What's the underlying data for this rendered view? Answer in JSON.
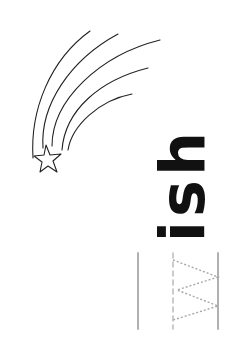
{
  "worksheet": {
    "word_remaining": "ish",
    "traced_letter": "W",
    "colors": {
      "ink": "#111111",
      "guide": "#b0b0b0",
      "trace": "#a8a8a8"
    },
    "illustration": "shooting-star"
  }
}
